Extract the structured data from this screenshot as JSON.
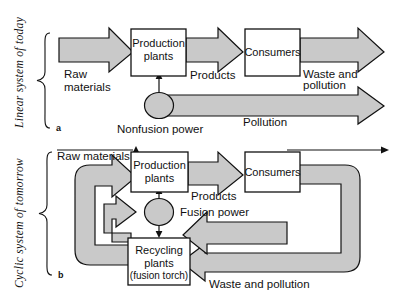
{
  "figure": {
    "background": "#ffffff",
    "flow_fill": "#c9c9c9",
    "outline": "#111111",
    "box_fill": "#ffffff"
  },
  "panels": [
    {
      "id": "a",
      "marker": "a",
      "side_label": "Linear system of today",
      "boxes": [
        {
          "name": "production-plants",
          "line1": "Production",
          "line2": "plants"
        },
        {
          "name": "consumers",
          "line1": "Consumers",
          "line2": ""
        }
      ],
      "node": {
        "name": "nonfusion-power",
        "label": "Nonfusion power"
      },
      "flow_labels": [
        {
          "name": "raw-materials",
          "line1": "Raw",
          "line2": "materials"
        },
        {
          "name": "products",
          "line1": "Products",
          "line2": ""
        },
        {
          "name": "waste-and-pollution",
          "line1": "Waste and",
          "line2": "pollution"
        },
        {
          "name": "pollution",
          "line1": "Pollution",
          "line2": ""
        }
      ]
    },
    {
      "id": "b",
      "marker": "b",
      "side_label": "Cyclic system of tomorrow",
      "boxes": [
        {
          "name": "production-plants",
          "line1": "Production",
          "line2": "plants",
          "line3": ""
        },
        {
          "name": "consumers",
          "line1": "Consumers",
          "line2": "",
          "line3": ""
        },
        {
          "name": "recycling-plants",
          "line1": "Recycling",
          "line2": "plants",
          "line3": "(fusion torch)"
        }
      ],
      "node": {
        "name": "fusion-power",
        "label": "Fusion power"
      },
      "flow_labels": [
        {
          "name": "raw-materials",
          "line1": "Raw materials",
          "line2": ""
        },
        {
          "name": "products",
          "line1": "Products",
          "line2": ""
        },
        {
          "name": "waste-and-pollution",
          "line1": "Waste and pollution",
          "line2": ""
        }
      ]
    }
  ]
}
